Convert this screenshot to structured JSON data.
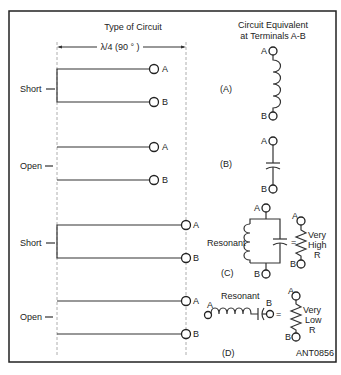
{
  "title_left": "Type of Circuit",
  "title_right_line1": "Circuit Equivalent",
  "title_right_line2": "at Terminals A-B",
  "dimension_label": "λ/4 (90 ° )",
  "circuits": [
    {
      "type": "Short",
      "tag": "(A)",
      "terminal_a": "A",
      "terminal_b": "B"
    },
    {
      "type": "Open",
      "tag": "(B)",
      "terminal_a": "A",
      "terminal_b": "B"
    },
    {
      "type": "Short",
      "tag": "(C)",
      "terminal_a": "A",
      "terminal_b": "B"
    },
    {
      "type": "Open",
      "tag": "(D)",
      "terminal_a": "A",
      "terminal_b": "B"
    }
  ],
  "equivalents": {
    "c_resonant": "Resonant",
    "c_equals": "=",
    "c_r_line1": "Very",
    "c_r_line2": "High",
    "c_r_line3": "R",
    "d_resonant": "Resonant",
    "d_equals": "=",
    "d_r_line1": "Very",
    "d_r_line2": "Low",
    "d_r_line3": "R"
  },
  "figure_id": "ANT0856"
}
